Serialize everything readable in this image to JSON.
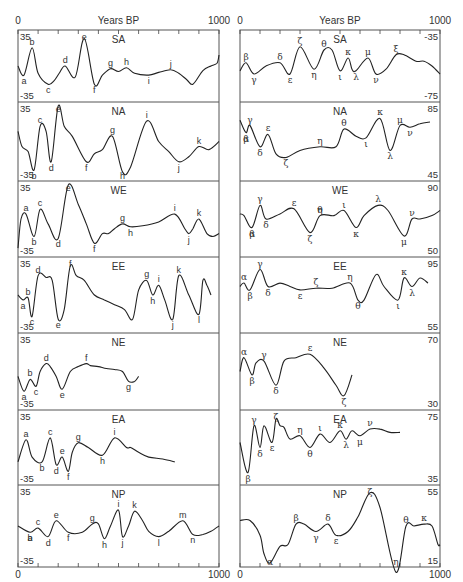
{
  "chart_data": {
    "type": "line",
    "xlabel": "Years BP",
    "xlim": [
      0,
      1000
    ],
    "x_ticks": [
      0,
      100,
      200,
      300,
      400,
      500,
      600,
      700,
      800,
      900,
      1000
    ],
    "x_tick_labels": [
      "0",
      "1000"
    ],
    "columns": [
      {
        "column": "left",
        "panels": [
          {
            "region": "SA",
            "ymax": "35",
            "ymin": "-35",
            "labels": [
              "a",
              "b",
              "c",
              "d",
              "e",
              "f",
              "g",
              "h",
              "i",
              "j"
            ],
            "x": [
              0,
              30,
              70,
              100,
              150,
              180,
              205,
              235,
              285,
              330,
              380,
              420,
              460,
              500,
              540,
              580,
              650,
              700,
              760,
              800,
              840,
              870,
              920,
              960,
              990,
              1000
            ],
            "y": [
              0,
              -10,
              20,
              -8,
              -20,
              -16,
              -8,
              0,
              -12,
              30,
              -20,
              -10,
              -3,
              -6,
              -2,
              -8,
              -10,
              -7,
              -4,
              -8,
              -15,
              -20,
              -5,
              0,
              3,
              12
            ]
          },
          {
            "region": "NA",
            "ymax": "35",
            "ymin": "-35",
            "labels": [
              "b",
              "c",
              "d",
              "e",
              "f",
              "g",
              "h",
              "i",
              "j",
              "k"
            ],
            "x": [
              0,
              20,
              50,
              80,
              110,
              140,
              165,
              200,
              230,
              270,
              340,
              380,
              420,
              470,
              520,
              560,
              640,
              700,
              750,
              800,
              850,
              900,
              950,
              1000
            ],
            "y": [
              10,
              -5,
              -10,
              -28,
              15,
              10,
              -20,
              35,
              15,
              5,
              -20,
              -12,
              -8,
              5,
              -30,
              -25,
              20,
              0,
              -10,
              -20,
              -15,
              -5,
              -8,
              0
            ]
          },
          {
            "region": "WE",
            "ymax": "35",
            "ymin": "-35",
            "labels": [
              "a",
              "b",
              "c",
              "d",
              "e",
              "f",
              "g",
              "h",
              "i",
              "j",
              "k"
            ],
            "x": [
              0,
              15,
              40,
              80,
              110,
              150,
              200,
              250,
              300,
              340,
              380,
              420,
              450,
              480,
              520,
              560,
              620,
              700,
              780,
              830,
              850,
              870,
              900,
              940,
              970,
              1000
            ],
            "y": [
              -30,
              0,
              5,
              -18,
              10,
              -5,
              -20,
              35,
              15,
              -5,
              -25,
              -15,
              -15,
              -10,
              -5,
              -8,
              -7,
              -3,
              5,
              -10,
              -15,
              -10,
              0,
              -15,
              -18,
              -15
            ]
          },
          {
            "region": "EE",
            "ymax": "35",
            "ymin": "-35",
            "labels": [
              "a",
              "b",
              "c",
              "d",
              "e",
              "f",
              "g",
              "h",
              "i",
              "j",
              "k",
              "l"
            ],
            "x": [
              0,
              25,
              50,
              70,
              100,
              140,
              170,
              200,
              230,
              260,
              290,
              330,
              380,
              430,
              480,
              530,
              570,
              600,
              640,
              670,
              700,
              730,
              770,
              800,
              850,
              900,
              920,
              940,
              960
            ],
            "y": [
              0,
              -5,
              -3,
              -22,
              20,
              18,
              15,
              -25,
              -15,
              30,
              20,
              15,
              0,
              -5,
              -10,
              -15,
              -25,
              5,
              15,
              0,
              10,
              -5,
              -25,
              20,
              0,
              -20,
              15,
              10,
              0
            ]
          },
          {
            "region": "NE",
            "ymax": "35",
            "ymin": "-35",
            "labels": [
              "a",
              "b",
              "c",
              "d",
              "e",
              "f",
              "g"
            ],
            "x": [
              0,
              30,
              60,
              90,
              110,
              140,
              160,
              190,
              220,
              260,
              300,
              340,
              360,
              400,
              440,
              480,
              520,
              550,
              580,
              600
            ],
            "y": [
              -5,
              -20,
              -8,
              -15,
              0,
              8,
              5,
              -5,
              -18,
              0,
              5,
              8,
              6,
              5,
              3,
              2,
              0,
              -10,
              -10,
              -5
            ]
          },
          {
            "region": "EA",
            "ymax": "35",
            "ymin": "-35",
            "labels": [
              "a",
              "b",
              "c",
              "d",
              "e",
              "f",
              "g",
              "h",
              "i"
            ],
            "x": [
              0,
              40,
              70,
              120,
              160,
              190,
              220,
              250,
              270,
              300,
              350,
              420,
              480,
              540,
              560,
              600,
              650,
              720,
              780
            ],
            "y": [
              -15,
              8,
              -10,
              -15,
              10,
              -18,
              -10,
              -25,
              -5,
              5,
              0,
              -8,
              10,
              0,
              0,
              -5,
              -10,
              -12,
              -15
            ]
          },
          {
            "region": "NP",
            "ymax": "35",
            "ymin": "-35",
            "labels": [
              "a",
              "b",
              "c",
              "d",
              "e",
              "f",
              "g",
              "h",
              "i",
              "j",
              "k",
              "l",
              "m",
              "n"
            ],
            "x": [
              0,
              60,
              100,
              150,
              190,
              250,
              320,
              370,
              400,
              430,
              460,
              500,
              520,
              550,
              580,
              620,
              650,
              700,
              750,
              820,
              870,
              920,
              960,
              1000
            ],
            "y": [
              0,
              -6,
              -2,
              -10,
              5,
              -6,
              -6,
              2,
              2,
              -12,
              0,
              15,
              -10,
              0,
              14,
              5,
              -5,
              -10,
              -5,
              5,
              -8,
              -8,
              -5,
              0
            ]
          }
        ]
      },
      {
        "column": "right",
        "panels": [
          {
            "region": "SA",
            "ymax": "-35",
            "ymin": "-75",
            "labels": [
              "β",
              "γ",
              "δ",
              "ε",
              "ζ",
              "η",
              "θ",
              "ι",
              "κ",
              "λ",
              "μ",
              "ν",
              "ξ"
            ],
            "x": [
              0,
              30,
              70,
              130,
              200,
              250,
              300,
              370,
              420,
              460,
              500,
              540,
              560,
              580,
              640,
              680,
              730,
              780,
              820,
              880,
              920,
              960,
              1000
            ],
            "y": [
              -58,
              -53,
              -60,
              -55,
              -53,
              -60,
              -43,
              -57,
              -45,
              -45,
              -58,
              -50,
              -57,
              -58,
              -50,
              -60,
              -57,
              -48,
              -48,
              -52,
              -52,
              -55,
              -60
            ]
          },
          {
            "region": "NA",
            "ymax": "85",
            "ymin": "45",
            "labels": [
              "α",
              "β",
              "γ",
              "δ",
              "ε",
              "ζ",
              "η",
              "θ",
              "ι",
              "κ",
              "λ",
              "μ",
              "ν"
            ],
            "x": [
              0,
              30,
              50,
              100,
              140,
              180,
              230,
              300,
              400,
              480,
              520,
              580,
              630,
              700,
              750,
              800,
              850,
              900,
              950
            ],
            "y": [
              77,
              70,
              74,
              62,
              69,
              58,
              56,
              60,
              62,
              62,
              72,
              68,
              67,
              78,
              60,
              74,
              73,
              75,
              76
            ]
          },
          {
            "region": "WE",
            "ymax": "90",
            "ymin": "50",
            "labels": [
              "α",
              "β",
              "γ",
              "δ",
              "ε",
              "ζ",
              "η",
              "θ",
              "ι",
              "κ",
              "λ",
              "μ",
              "ν"
            ],
            "x": [
              0,
              20,
              60,
              100,
              130,
              200,
              270,
              350,
              400,
              470,
              520,
              580,
              620,
              690,
              740,
              820,
              860,
              900,
              960,
              1000
            ],
            "y": [
              73,
              72,
              65,
              78,
              70,
              73,
              76,
              62,
              72,
              72,
              75,
              65,
              72,
              78,
              75,
              60,
              70,
              70,
              72,
              75
            ]
          },
          {
            "region": "EE",
            "ymax": "95",
            "ymin": "55",
            "labels": [
              "α",
              "β",
              "γ",
              "δ",
              "ε",
              "ζ",
              "η",
              "θ",
              "ι",
              "κ",
              "λ"
            ],
            "x": [
              0,
              20,
              50,
              100,
              140,
              200,
              250,
              300,
              380,
              460,
              550,
              590,
              620,
              680,
              720,
              790,
              820,
              860,
              900,
              940
            ],
            "y": [
              80,
              82,
              78,
              90,
              80,
              82,
              80,
              78,
              79,
              79,
              82,
              72,
              72,
              87,
              80,
              72,
              85,
              80,
              85,
              82
            ]
          },
          {
            "region": "NE",
            "ymax": "70",
            "ymin": "30",
            "labels": [
              "α",
              "β",
              "γ",
              "δ",
              "ε",
              "ζ"
            ],
            "x": [
              0,
              20,
              60,
              80,
              120,
              180,
              220,
              280,
              350,
              420,
              480,
              520,
              560
            ],
            "y": [
              50,
              58,
              48,
              55,
              56,
              42,
              56,
              58,
              60,
              52,
              42,
              36,
              48
            ]
          },
          {
            "region": "EA",
            "ymax": "75",
            "ymin": "35",
            "labels": [
              "β",
              "γ",
              "δ",
              "ε",
              "ζ",
              "η",
              "θ",
              "ι",
              "κ",
              "λ",
              "μ",
              "ν"
            ],
            "x": [
              0,
              40,
              70,
              100,
              120,
              160,
              180,
              200,
              220,
              250,
              300,
              350,
              400,
              450,
              500,
              530,
              560,
              600,
              650,
              700,
              750,
              800
            ],
            "y": [
              58,
              40,
              68,
              55,
              68,
              58,
              72,
              68,
              67,
              60,
              62,
              55,
              63,
              58,
              65,
              60,
              65,
              62,
              66,
              66,
              64,
              64
            ]
          },
          {
            "region": "NP",
            "ymax": "55",
            "ymin": "15",
            "labels": [
              "α",
              "β",
              "γ",
              "δ",
              "ε",
              "ζ",
              "η",
              "θ",
              "κ"
            ],
            "x": [
              0,
              50,
              100,
              120,
              150,
              200,
              240,
              280,
              320,
              380,
              440,
              480,
              540,
              590,
              650,
              700,
              780,
              830,
              870,
              920,
              960,
              990,
              1000
            ],
            "y": [
              38,
              38,
              30,
              20,
              15,
              24,
              25,
              36,
              36,
              32,
              36,
              30,
              32,
              40,
              53,
              45,
              10,
              35,
              35,
              36,
              35,
              25,
              25
            ]
          }
        ]
      }
    ]
  },
  "axis": {
    "title_left": "Years BP",
    "title_right": "Years BP",
    "x_start": "0",
    "x_end": "1000"
  },
  "left_panels": [
    {
      "name": "SA",
      "ymax": "35",
      "ymin": "-35"
    },
    {
      "name": "NA",
      "ymax": "35",
      "ymin": "-35"
    },
    {
      "name": "WE",
      "ymax": "35",
      "ymin": "-35"
    },
    {
      "name": "EE",
      "ymax": "35",
      "ymin": "-35"
    },
    {
      "name": "NE",
      "ymax": "35",
      "ymin": "-35"
    },
    {
      "name": "EA",
      "ymax": "35",
      "ymin": "-35"
    },
    {
      "name": "NP",
      "ymax": "35",
      "ymin": "-35"
    }
  ],
  "right_panels": [
    {
      "name": "SA",
      "ymax": "-35",
      "ymin": "-75"
    },
    {
      "name": "NA",
      "ymax": "85",
      "ymin": "45"
    },
    {
      "name": "WE",
      "ymax": "90",
      "ymin": "50"
    },
    {
      "name": "EE",
      "ymax": "95",
      "ymin": "55"
    },
    {
      "name": "NE",
      "ymax": "70",
      "ymin": "30"
    },
    {
      "name": "EA",
      "ymax": "75",
      "ymin": "35"
    },
    {
      "name": "NP",
      "ymax": "55",
      "ymin": "15"
    }
  ]
}
